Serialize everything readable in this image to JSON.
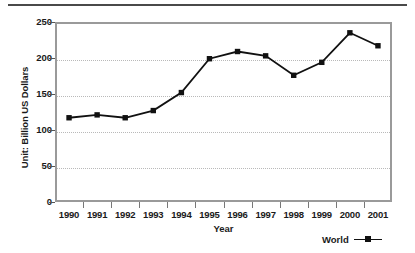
{
  "chart_data": {
    "type": "line",
    "title": "",
    "subtitle": "",
    "xlabel": "Year",
    "ylabel": "Unit: Billion US Dollars",
    "categories": [
      "1990",
      "1991",
      "1992",
      "1993",
      "1994",
      "1995",
      "1996",
      "1997",
      "1998",
      "1999",
      "2000",
      "2001"
    ],
    "series": [
      {
        "name": "World",
        "values": [
          117,
          121,
          117,
          127,
          152,
          199,
          209,
          203,
          176,
          194,
          235,
          217
        ],
        "color": "#111111",
        "marker": "square"
      }
    ],
    "ylim": [
      0,
      250
    ],
    "yticks": [
      0,
      50,
      100,
      150,
      200,
      250
    ],
    "ytick_labels": [
      "0",
      "50",
      "100",
      "150",
      "200",
      "250"
    ],
    "grid": "horizontal-dotted",
    "legend_position": "bottom-right",
    "legend_entries": [
      "World"
    ]
  },
  "axes": {
    "y_title": "Unit: Billion US Dollars",
    "x_title": "Year"
  },
  "legend": {
    "series_label": "World"
  },
  "colors": {
    "line": "#111111",
    "marker": "#111111",
    "grid": "#b9b9b9",
    "frame": "#9a9a9a",
    "rule": "#4a4a4a",
    "text": "#1a1a1a"
  }
}
